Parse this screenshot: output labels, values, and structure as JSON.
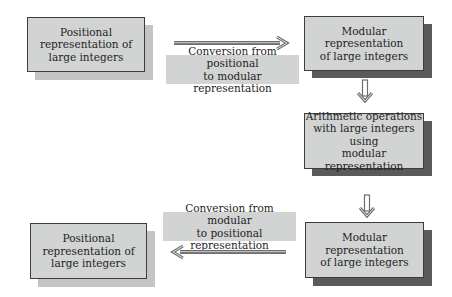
{
  "diagram": {
    "nodes": [
      {
        "id": "positional-top",
        "text": "Positional\nrepresentation of\nlarge integers",
        "shadow": "light"
      },
      {
        "id": "modular-top",
        "text": "Modular representation\nof large integers",
        "shadow": "dark"
      },
      {
        "id": "arithmetic",
        "text": "Arithmetic operations\nwith large integers using\nmodular representation",
        "shadow": "dark"
      },
      {
        "id": "modular-bottom",
        "text": "Modular representation\nof large integers",
        "shadow": "dark"
      },
      {
        "id": "positional-bottom",
        "text": "Positional\nrepresentation of\nlarge integers",
        "shadow": "light"
      }
    ],
    "edges": [
      {
        "from": "positional-top",
        "to": "modular-top",
        "label": "Conversion from positional\nto modular representation",
        "direction": "right"
      },
      {
        "from": "modular-top",
        "to": "arithmetic",
        "label": "",
        "direction": "down"
      },
      {
        "from": "arithmetic",
        "to": "modular-bottom",
        "label": "",
        "direction": "down"
      },
      {
        "from": "modular-bottom",
        "to": "positional-bottom",
        "label": "Conversion from modular\nto positional representation",
        "direction": "left"
      }
    ],
    "colors": {
      "box_fill": "#d2d4d4",
      "box_border": "#3c3c3c",
      "shadow_light": "#c4c4c4",
      "shadow_dark": "#5a5a5a",
      "arrow": "#6e6e6e",
      "background": "#ffffff"
    }
  }
}
